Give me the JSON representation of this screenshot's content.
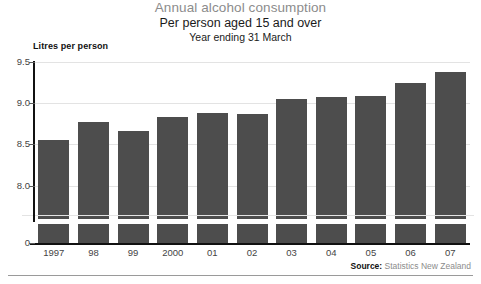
{
  "titles": {
    "main": "Annual alcohol consumption",
    "sub": "Per person aged 15 and over",
    "sub2": "Year ending 31 March"
  },
  "axis": {
    "unit_label": "Litres per person",
    "y_ticks": [
      "9.5",
      "9.0",
      "8.5",
      "8.0",
      "0"
    ]
  },
  "source": {
    "prefix": "Source:",
    "text": " Statistics New Zealand"
  },
  "colors": {
    "bar": "#4d4d4d",
    "grid": "#e3e3e3",
    "axis": "#111111",
    "title": "#8c8c8c"
  },
  "chart_data": {
    "type": "bar",
    "title": "Annual alcohol consumption",
    "subtitle": "Per person aged 15 and over — Year ending 31 March",
    "xlabel": "",
    "ylabel": "Litres per person",
    "categories": [
      "1997",
      "98",
      "99",
      "2000",
      "01",
      "02",
      "03",
      "04",
      "05",
      "06",
      "07"
    ],
    "values": [
      8.55,
      8.77,
      8.66,
      8.83,
      8.88,
      8.87,
      9.05,
      9.07,
      9.08,
      9.24,
      9.38
    ],
    "ylim": [
      7.75,
      9.5
    ],
    "y_ticks": [
      9.5,
      9.0,
      8.5,
      8.0,
      0
    ],
    "axis_break": true,
    "grid": true,
    "legend": "none",
    "source": "Source: Statistics New Zealand"
  }
}
